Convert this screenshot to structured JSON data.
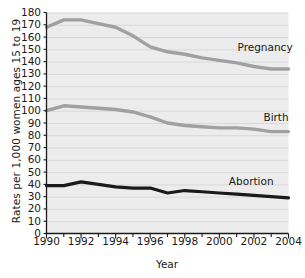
{
  "chart_data": {
    "type": "line",
    "title": "",
    "xlabel": "Year",
    "ylabel": "Rates per 1,000 women ages 15 to 19",
    "xlim": [
      1990,
      2004
    ],
    "ylim": [
      0,
      180
    ],
    "ytick_step": 10,
    "xtick_step": 1,
    "xtick_label_step": 2,
    "grid": "horizontal",
    "legend_position": "inline-right",
    "plot_background": "#ececec",
    "gridline_color": "#d6d6d6",
    "x": [
      1990,
      1991,
      1992,
      1993,
      1994,
      1995,
      1996,
      1997,
      1998,
      1999,
      2000,
      2001,
      2002,
      2003,
      2004
    ],
    "categories": [
      "1990",
      "1991",
      "1992",
      "1993",
      "1994",
      "1995",
      "1996",
      "1997",
      "1998",
      "1999",
      "2000",
      "2001",
      "2002",
      "2003",
      "2004"
    ],
    "ytick_labels": [
      "180",
      "170",
      "160",
      "150",
      "140",
      "130",
      "120",
      "110",
      "100",
      "90",
      "80",
      "70",
      "60",
      "50",
      "40",
      "30",
      "20",
      "10",
      "0"
    ],
    "ytick_values": [
      180,
      170,
      160,
      150,
      140,
      130,
      120,
      110,
      100,
      90,
      80,
      70,
      60,
      50,
      40,
      30,
      20,
      10,
      0
    ],
    "xtick_labels": [
      "1990",
      "1992",
      "1994",
      "1996",
      "1998",
      "2000",
      "2002",
      "2004"
    ],
    "xtick_values": [
      1990,
      1992,
      1994,
      1996,
      1998,
      2000,
      2002,
      2004
    ],
    "series": [
      {
        "name": "Pregnancy",
        "color": "#a0a0a0",
        "width": 3.4,
        "label_x": 2001.05,
        "label_y": 152,
        "values": [
          168,
          174,
          174,
          171,
          168,
          161,
          152,
          148,
          146,
          143,
          141,
          139,
          136,
          134,
          134
        ]
      },
      {
        "name": "Birth",
        "color": "#a0a0a0",
        "width": 3.4,
        "label_x": 2002.55,
        "label_y": 95,
        "values": [
          100,
          104,
          103,
          102,
          101,
          99,
          95,
          90,
          88,
          87,
          86,
          86,
          85,
          83,
          83
        ]
      },
      {
        "name": "Abortion",
        "color": "#1a1a1a",
        "width": 3.2,
        "label_x": 2000.55,
        "label_y": 43,
        "values": [
          39,
          39,
          42,
          40,
          38,
          37,
          37,
          33,
          35,
          34,
          33,
          32,
          31,
          30,
          29
        ]
      }
    ]
  }
}
